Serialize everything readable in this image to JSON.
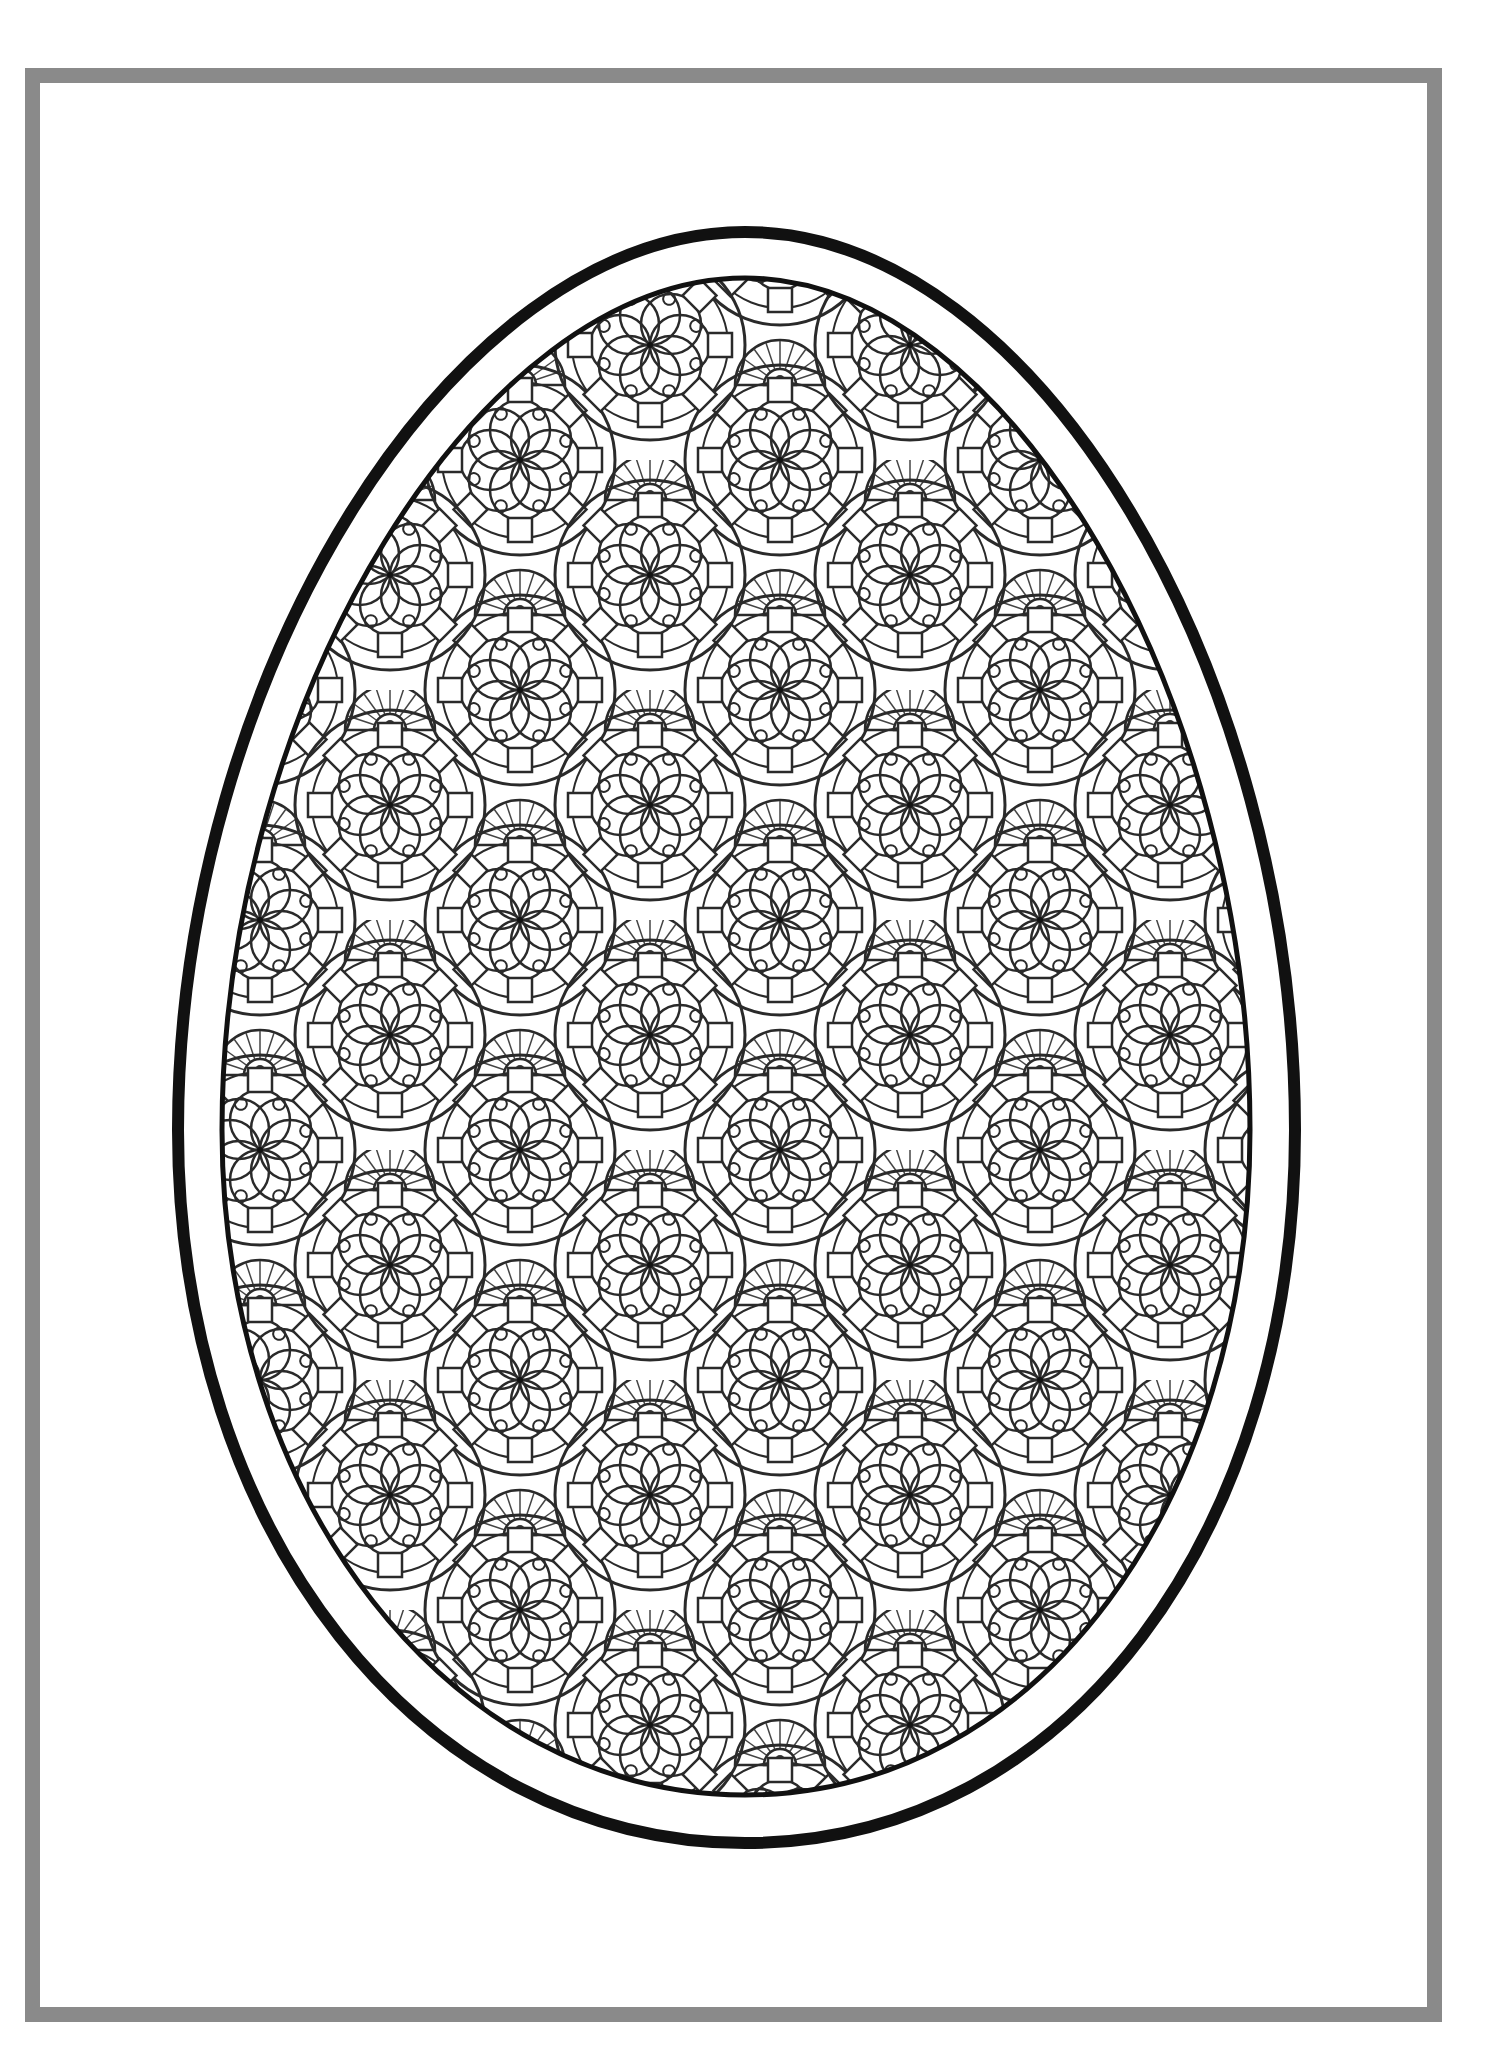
{
  "page": {
    "type": "coloring-page",
    "background": "#ffffff"
  },
  "frame": {
    "color": "#8a8a8a",
    "thickness_px": 15,
    "left": 25,
    "top": 68,
    "right": 1442,
    "bottom": 2022
  },
  "egg": {
    "outline_color": "#111111",
    "outer_stroke_px": 12,
    "inner_stroke_px": 5,
    "center_x": 745,
    "pattern": "repeating-mandala-flowers",
    "line_color": "#2a2a2a"
  }
}
